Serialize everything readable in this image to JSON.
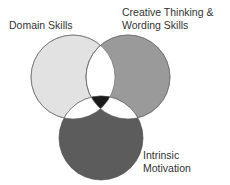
{
  "diagram": {
    "type": "venn",
    "circles": [
      {
        "id": "domain",
        "label": "Domain Skills",
        "color": "#e2e2e2"
      },
      {
        "id": "creative",
        "label_line1": "Creative Thinking &",
        "label_line2": "Wording Skills",
        "color": "#9a9a9a"
      },
      {
        "id": "motivation",
        "label_line1": "Intrinsic",
        "label_line2": "Motivation",
        "color": "#5c5c5c"
      }
    ],
    "center_color": "#1a1a1a",
    "pairwise_overlap_color": "#ffffff"
  }
}
